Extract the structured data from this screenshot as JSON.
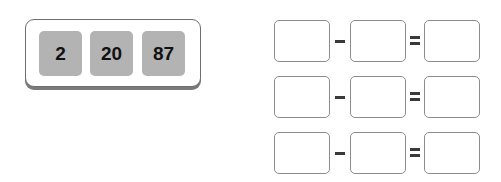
{
  "number_card": {
    "tiles": [
      {
        "value": "2"
      },
      {
        "value": "20"
      },
      {
        "value": "87"
      }
    ]
  },
  "equations": [
    {
      "operator": "minus",
      "equals": "equals",
      "left": "",
      "right": "",
      "result": ""
    },
    {
      "operator": "minus",
      "equals": "equals",
      "left": "",
      "right": "",
      "result": ""
    },
    {
      "operator": "minus",
      "equals": "equals",
      "left": "",
      "right": "",
      "result": ""
    }
  ],
  "colors": {
    "tile_fill": "#b3b3b3",
    "card_border": "#6e6e6e",
    "box_border": "#8c8c8c"
  }
}
